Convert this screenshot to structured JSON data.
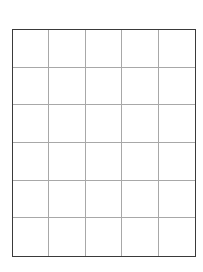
{
  "grid": {
    "columns": 5,
    "rows": 6,
    "border_color": "#3a3a3a",
    "line_color": "#a8a8a8",
    "background": "#ffffff"
  }
}
